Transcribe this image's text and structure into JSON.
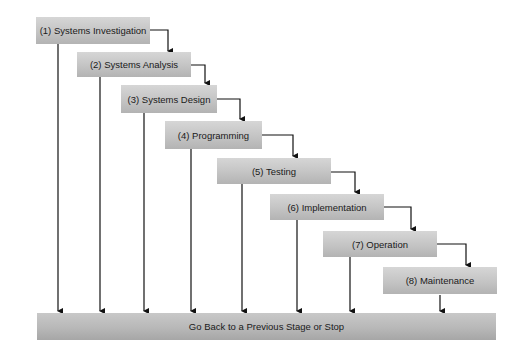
{
  "diagram": {
    "type": "waterfall-sdlc",
    "stages": [
      {
        "id": 1,
        "label": "(1) Systems Investigation"
      },
      {
        "id": 2,
        "label": "(2) Systems Analysis"
      },
      {
        "id": 3,
        "label": "(3) Systems Design"
      },
      {
        "id": 4,
        "label": "(4) Programming"
      },
      {
        "id": 5,
        "label": "(5) Testing"
      },
      {
        "id": 6,
        "label": "(6) Implementation"
      },
      {
        "id": 7,
        "label": "(7) Operation"
      },
      {
        "id": 8,
        "label": "(8) Maintenance"
      }
    ],
    "return_bar": {
      "label": "Go Back to a Previous Stage or Stop"
    },
    "edges": [
      {
        "from": 1,
        "to": 2
      },
      {
        "from": 2,
        "to": 3
      },
      {
        "from": 3,
        "to": 4
      },
      {
        "from": 4,
        "to": 5
      },
      {
        "from": 5,
        "to": 6
      },
      {
        "from": 6,
        "to": 7
      },
      {
        "from": 7,
        "to": 8
      },
      {
        "from": 1,
        "to": "return_bar"
      },
      {
        "from": 2,
        "to": "return_bar"
      },
      {
        "from": 3,
        "to": "return_bar"
      },
      {
        "from": 4,
        "to": "return_bar"
      },
      {
        "from": 5,
        "to": "return_bar"
      },
      {
        "from": 6,
        "to": "return_bar"
      },
      {
        "from": 7,
        "to": "return_bar"
      },
      {
        "from": 8,
        "to": "return_bar"
      }
    ],
    "colors": {
      "box": "#c4c4c4",
      "bar": "#b8b8b8",
      "line": "#111111",
      "text": "#1a1a1a"
    }
  }
}
